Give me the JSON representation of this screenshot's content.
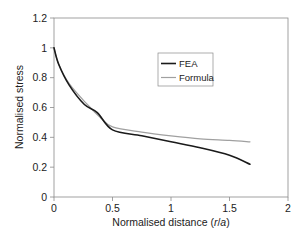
{
  "chart_data": {
    "type": "line",
    "title": "",
    "xlabel": "Normalised distance (r/a)",
    "xlabel_parts": {
      "prefix": "Normalised distance (",
      "var1": "r",
      "sep": "/",
      "var2": "a",
      "suffix": ")"
    },
    "ylabel": "Normalised stress",
    "xlim": [
      0,
      2
    ],
    "ylim": [
      0,
      1.2
    ],
    "xticks": [
      0,
      0.5,
      1,
      1.5,
      2
    ],
    "xtick_labels": [
      "0",
      "0.5",
      "1",
      "1.5",
      "2"
    ],
    "yticks": [
      0,
      0.2,
      0.4,
      0.6,
      0.8,
      1,
      1.2
    ],
    "ytick_labels": [
      "0",
      "0.2",
      "0.4",
      "0.6",
      "0.8",
      "1",
      "1.2"
    ],
    "grid": false,
    "legend_position": "center-right (inside plot)",
    "series": [
      {
        "name": "FEA",
        "color": "#1a1a1a",
        "width": 1.6,
        "x": [
          0,
          0.04,
          0.13,
          0.26,
          0.37,
          0.5,
          0.75,
          1.0,
          1.25,
          1.5,
          1.675
        ],
        "values": [
          1.0,
          0.89,
          0.75,
          0.62,
          0.566,
          0.45,
          0.41,
          0.37,
          0.33,
          0.28,
          0.22
        ]
      },
      {
        "name": "Formula",
        "color": "#a0a0a0",
        "width": 1.2,
        "x": [
          0,
          0.04,
          0.13,
          0.285,
          0.4,
          0.5,
          0.75,
          1.0,
          1.25,
          1.5,
          1.675
        ],
        "values": [
          1.0,
          0.89,
          0.76,
          0.62,
          0.53,
          0.47,
          0.435,
          0.41,
          0.39,
          0.38,
          0.37
        ]
      }
    ]
  },
  "legend": {
    "items": [
      {
        "label": "FEA",
        "color": "#1a1a1a"
      },
      {
        "label": "Formula",
        "color": "#a0a0a0"
      }
    ]
  },
  "axes": {
    "x_label": "Normalised distance (r/a)",
    "y_label": "Normalised stress"
  }
}
